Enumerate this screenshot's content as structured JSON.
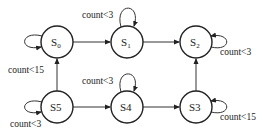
{
  "diagram": {
    "type": "state-machine",
    "states": [
      {
        "id": "S0",
        "base": "S",
        "sub": "0",
        "cx": 57,
        "cy": 42
      },
      {
        "id": "S1",
        "base": "S",
        "sub": "1",
        "cx": 127,
        "cy": 42
      },
      {
        "id": "S2",
        "base": "S",
        "sub": "2",
        "cx": 196,
        "cy": 42
      },
      {
        "id": "S5",
        "base": "S5",
        "sub": "",
        "cx": 57,
        "cy": 107
      },
      {
        "id": "S4",
        "base": "S4",
        "sub": "",
        "cx": 127,
        "cy": 107
      },
      {
        "id": "S3",
        "base": "S3",
        "sub": "",
        "cx": 196,
        "cy": 107
      }
    ],
    "transitions": [
      {
        "from": "S0",
        "to": "S1"
      },
      {
        "from": "S1",
        "to": "S2"
      },
      {
        "from": "S3",
        "to": "S2"
      },
      {
        "from": "S4",
        "to": "S3"
      },
      {
        "from": "S5",
        "to": "S4"
      },
      {
        "from": "S5",
        "to": "S0"
      }
    ],
    "self_loops": [
      {
        "state": "S0",
        "label": "count<15"
      },
      {
        "state": "S1",
        "label": "count<3"
      },
      {
        "state": "S2",
        "label": "count<3"
      },
      {
        "state": "S5",
        "label": "count<3"
      },
      {
        "state": "S4",
        "label": "count<3"
      },
      {
        "state": "S3",
        "label": "count<15"
      }
    ]
  }
}
